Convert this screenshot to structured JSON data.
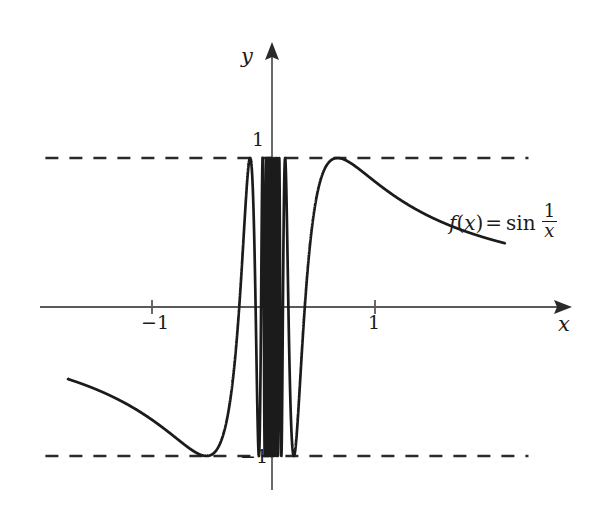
{
  "figure": {
    "title": "",
    "background_color": "#ffffff",
    "curve_color": "#1b1b1b",
    "axis_color": "#5a5a5a",
    "dash_color": "#2a2a2a"
  },
  "axes": {
    "y_axis_label": "y",
    "x_axis_label": "x",
    "y_tick_top_label": "1",
    "y_tick_bottom_label": "−1",
    "x_tick_left_label": "−1",
    "x_tick_right_label": "1"
  },
  "annotation": {
    "function_f": "f",
    "open_paren": "(",
    "variable": "x",
    "close_paren": ")",
    "equals": "=",
    "sin": "sin",
    "fraction_numerator": "1",
    "fraction_denominator": "x",
    "full_text": "f(x) = sin 1/x"
  },
  "chart_data": {
    "type": "line",
    "title": "",
    "xlabel": "x",
    "ylabel": "y",
    "xlim": [
      -2.25,
      2.9
    ],
    "ylim": [
      -1.28,
      1.28
    ],
    "grid": false,
    "legend": null,
    "annotations": [
      {
        "text": "f(x) = sin 1/x",
        "x": 1.72,
        "y": 0.66
      }
    ],
    "asymptotes": [
      {
        "type": "horizontal",
        "y": 1,
        "style": "dashed",
        "x_start": -2.2,
        "x_end": 2.49
      },
      {
        "type": "horizontal",
        "y": -1,
        "style": "dashed",
        "x_start": -2.2,
        "x_end": 2.49
      }
    ],
    "xticks": [
      -1,
      1
    ],
    "xtick_labels": [
      "−1",
      "1"
    ],
    "yticks": [
      -1,
      1
    ],
    "ytick_labels": [
      "−1",
      "1"
    ],
    "series": [
      {
        "name": "f(x) = sin 1/x",
        "equation": "sin(1/x)",
        "color": "#1b1b1b",
        "linewidth": 2.6,
        "x_domain_left": [
          -1.98,
          -1e-05
        ],
        "x_domain_right": [
          1e-05,
          2.26
        ],
        "sampled_points": [
          {
            "x": -1.98,
            "y": -0.478
          },
          {
            "x": -1.8,
            "y": -0.519
          },
          {
            "x": -1.6,
            "y": -0.573
          },
          {
            "x": -1.4,
            "y": -0.637
          },
          {
            "x": -1.2,
            "y": -0.718
          },
          {
            "x": -1.0,
            "y": -0.841
          },
          {
            "x": -0.9,
            "y": -0.916
          },
          {
            "x": -0.8,
            "y": -0.975
          },
          {
            "x": -0.75,
            "y": -0.994
          },
          {
            "x": -0.7,
            "y": -0.999
          },
          {
            "x": -0.65,
            "y": -0.983
          },
          {
            "x": -0.6,
            "y": -0.937
          },
          {
            "x": -0.55,
            "y": -0.845
          },
          {
            "x": -0.5,
            "y": -0.681
          },
          {
            "x": -0.45,
            "y": -0.415
          },
          {
            "x": -0.4,
            "y": -0.03
          },
          {
            "x": -0.35,
            "y": 0.478
          },
          {
            "x": -0.32,
            "y": 0.805
          },
          {
            "x": -0.3,
            "y": 0.958
          },
          {
            "x": -0.28,
            "y": 0.998
          },
          {
            "x": -0.26,
            "y": 0.898
          },
          {
            "x": -0.24,
            "y": 0.631
          },
          {
            "x": -0.22,
            "y": 0.184
          },
          {
            "x": -0.2,
            "y": -0.375
          },
          {
            "x": -0.18,
            "y": -0.878
          },
          {
            "x": -0.16,
            "y": -0.999
          },
          {
            "x": -0.15,
            "y": -0.92
          },
          {
            "x": -0.14,
            "y": -0.646
          },
          {
            "x": -0.13,
            "y": -0.155
          },
          {
            "x": -0.12,
            "y": 0.452
          },
          {
            "x": -0.11,
            "y": 0.93
          },
          {
            "x": -0.105,
            "y": 0.999
          },
          {
            "x": -0.1,
            "y": 0.544
          },
          {
            "x": -0.095,
            "y": -0.186
          },
          {
            "x": -0.09,
            "y": -0.845
          },
          {
            "x": -0.085,
            "y": -0.99
          },
          {
            "x": -0.08,
            "y": -0.491
          },
          {
            "x": -0.075,
            "y": 0.334
          },
          {
            "x": -0.07,
            "y": 0.95
          },
          {
            "x": -0.065,
            "y": 0.79
          },
          {
            "x": -0.06,
            "y": -0.118
          },
          {
            "x": -0.055,
            "y": -0.904
          },
          {
            "x": -0.05,
            "y": -0.912
          },
          {
            "x": -0.045,
            "y": -0.07
          },
          {
            "x": -0.04,
            "y": 0.87
          },
          {
            "x": -0.035,
            "y": 0.677
          },
          {
            "x": -0.03,
            "y": -0.605
          },
          {
            "x": -0.025,
            "y": -0.746
          },
          {
            "x": -0.02,
            "y": 0.998
          },
          {
            "x": -0.015,
            "y": -0.73
          },
          {
            "x": -0.01,
            "y": 0.506
          },
          {
            "x": 0.01,
            "y": -0.506
          },
          {
            "x": 0.015,
            "y": 0.73
          },
          {
            "x": 0.02,
            "y": -0.998
          },
          {
            "x": 0.025,
            "y": 0.746
          },
          {
            "x": 0.03,
            "y": 0.605
          },
          {
            "x": 0.035,
            "y": -0.677
          },
          {
            "x": 0.04,
            "y": -0.87
          },
          {
            "x": 0.045,
            "y": 0.07
          },
          {
            "x": 0.05,
            "y": 0.912
          },
          {
            "x": 0.055,
            "y": 0.904
          },
          {
            "x": 0.06,
            "y": 0.118
          },
          {
            "x": 0.065,
            "y": -0.79
          },
          {
            "x": 0.07,
            "y": -0.95
          },
          {
            "x": 0.075,
            "y": -0.334
          },
          {
            "x": 0.08,
            "y": 0.491
          },
          {
            "x": 0.085,
            "y": 0.99
          },
          {
            "x": 0.09,
            "y": 0.845
          },
          {
            "x": 0.095,
            "y": 0.186
          },
          {
            "x": 0.1,
            "y": -0.544
          },
          {
            "x": 0.105,
            "y": -0.999
          },
          {
            "x": 0.11,
            "y": -0.93
          },
          {
            "x": 0.12,
            "y": -0.452
          },
          {
            "x": 0.13,
            "y": 0.155
          },
          {
            "x": 0.14,
            "y": 0.646
          },
          {
            "x": 0.15,
            "y": 0.92
          },
          {
            "x": 0.16,
            "y": 0.999
          },
          {
            "x": 0.18,
            "y": 0.878
          },
          {
            "x": 0.2,
            "y": 0.375
          },
          {
            "x": 0.22,
            "y": -0.184
          },
          {
            "x": 0.24,
            "y": -0.631
          },
          {
            "x": 0.26,
            "y": -0.898
          },
          {
            "x": 0.28,
            "y": -0.998
          },
          {
            "x": 0.3,
            "y": -0.958
          },
          {
            "x": 0.32,
            "y": -0.805
          },
          {
            "x": 0.35,
            "y": -0.478
          },
          {
            "x": 0.4,
            "y": 0.03
          },
          {
            "x": 0.45,
            "y": 0.415
          },
          {
            "x": 0.5,
            "y": 0.681
          },
          {
            "x": 0.55,
            "y": 0.845
          },
          {
            "x": 0.6,
            "y": 0.937
          },
          {
            "x": 0.65,
            "y": 0.983
          },
          {
            "x": 0.7,
            "y": 0.999
          },
          {
            "x": 0.8,
            "y": 0.975
          },
          {
            "x": 0.9,
            "y": 0.916
          },
          {
            "x": 1.0,
            "y": 0.841
          },
          {
            "x": 1.2,
            "y": 0.718
          },
          {
            "x": 1.4,
            "y": 0.637
          },
          {
            "x": 1.6,
            "y": 0.573
          },
          {
            "x": 1.8,
            "y": 0.519
          },
          {
            "x": 2.0,
            "y": 0.479
          },
          {
            "x": 2.26,
            "y": 0.43
          }
        ]
      }
    ]
  }
}
